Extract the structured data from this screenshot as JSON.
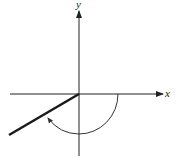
{
  "diagram": {
    "type": "angle-in-standard-position",
    "axes": {
      "x_label": "x",
      "y_label": "y"
    },
    "angle": {
      "direction": "clockwise",
      "initial_side": "positive x-axis",
      "terminal_side_quadrant": "III",
      "approx_degrees": -210
    },
    "colors": {
      "axis": "#222222",
      "terminal_side": "#1a1a1a",
      "arc": "#333333",
      "background": "#ffffff"
    }
  }
}
